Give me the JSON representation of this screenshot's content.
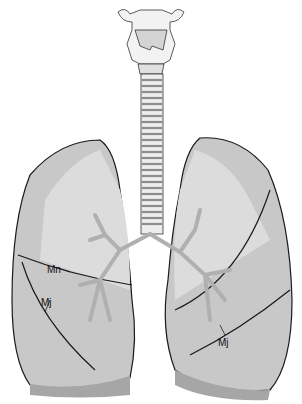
{
  "figure": {
    "labels": [
      {
        "id": "mn-left",
        "text": "Mn",
        "x": 47,
        "y": 264
      },
      {
        "id": "mj-left",
        "text": "Mj",
        "x": 41,
        "y": 297
      },
      {
        "id": "mj-right",
        "text": "Mj",
        "x": 218,
        "y": 337
      }
    ],
    "colors": {
      "lung_fill": "#c8c8c8",
      "lung_light": "#e6e6e6",
      "lung_dark": "#a6a6a6",
      "outline": "#1a1a1a",
      "trachea_fill": "#ededed",
      "trachea_ring": "#9a9a9a",
      "bronchi": "#b8b8b8"
    }
  }
}
